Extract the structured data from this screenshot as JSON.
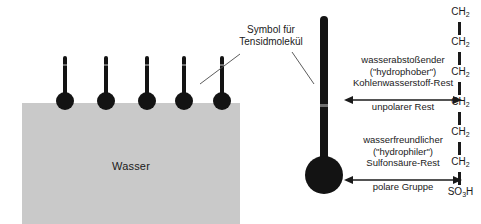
{
  "diagram": {
    "colors": {
      "water_fill": "#c9c9c9",
      "molecule": "#131313",
      "text": "#1a1a1a",
      "background": "#ffffff"
    }
  },
  "water": {
    "label": "Wasser"
  },
  "callout": {
    "line1": "Symbol für",
    "line2": "Tensidmolekül"
  },
  "hydrophobic": {
    "line1": "wasserabstoßender",
    "line2": "(\"hydrophober\")",
    "line3": "Kohlenwasserstoff-Rest",
    "arrow_label": "unpolarer Rest"
  },
  "hydrophilic": {
    "line1": "wasserfreundlicher",
    "line2": "(\"hydrophiler\")",
    "line3": "Sulfonsäure-Rest",
    "arrow_label": "polare Gruppe"
  },
  "chain": {
    "units": [
      {
        "formula": "CH",
        "sub": "2"
      },
      {
        "formula": "CH",
        "sub": "2"
      },
      {
        "formula": "CH",
        "sub": "2"
      },
      {
        "formula": "CH",
        "sub": "2"
      },
      {
        "formula": "CH",
        "sub": "2"
      },
      {
        "formula": "CH",
        "sub": "2"
      },
      {
        "formula": "SO",
        "sub": "3",
        "tail": "H"
      }
    ]
  },
  "molecules": {
    "small_count": 5,
    "small_label": "Tensidmolekül an der Wasseroberfläche",
    "large_label": "Vergrößertes Tensidmolekül"
  }
}
